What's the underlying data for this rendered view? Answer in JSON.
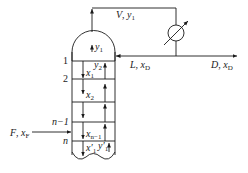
{
  "diagram": {
    "streams": {
      "vapor_top": {
        "name": "V",
        "comp": "y",
        "sub": "1"
      },
      "reflux": {
        "name": "L",
        "comp": "x",
        "sub": "D"
      },
      "distillate": {
        "name": "D",
        "comp": "x",
        "sub": "D"
      },
      "feed": {
        "name": "F",
        "comp": "x",
        "sub": "F"
      }
    },
    "trays": [
      {
        "label": "1"
      },
      {
        "label": "2"
      },
      {
        "label": "n−1"
      },
      {
        "label": "n"
      }
    ],
    "internal_labels": {
      "y1": {
        "base": "y",
        "sub": "1"
      },
      "y2": {
        "base": "y",
        "sub": "2"
      },
      "x1": {
        "base": "x",
        "sub": "1"
      },
      "x2": {
        "base": "x",
        "sub": "2"
      },
      "xn1": {
        "base": "x",
        "sub": "n−1"
      },
      "x1p": {
        "base": "x′",
        "sub": "1"
      },
      "y1p": {
        "base": "y′",
        "sub": "1"
      }
    },
    "separator": ", ",
    "colors": {
      "line": "#1a1a1a",
      "background": "#ffffff"
    }
  }
}
